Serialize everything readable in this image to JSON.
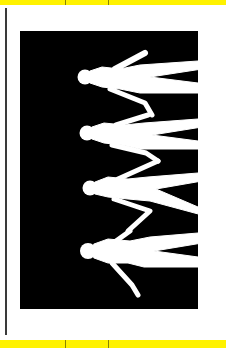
{
  "image": {
    "description": "Rotated black-and-white silhouette of four people holding hands, printed on a page with yellow margin bars",
    "subject": "four human silhouettes holding hands",
    "figure_count": 4,
    "colors": {
      "background": "#000000",
      "silhouette": "#ffffff",
      "margin_bar": "#fff200",
      "page": "#ffffff"
    }
  }
}
